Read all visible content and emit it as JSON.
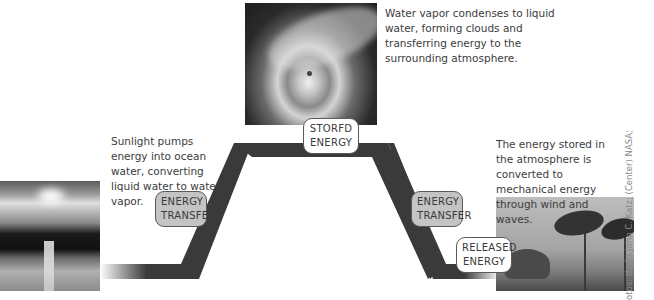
{
  "captions": {
    "condense": "Water vapor condenses to liquid water, forming clouds and transferring energy to the surrounding atmosphere.",
    "sunlight": "Sunlight pumps energy into ocean water, converting liquid water to water vapor.",
    "release": "The energy stored in the atmosphere is converted to mechanical energy through wind and waves."
  },
  "labels": {
    "stored": "STORED ENERGY",
    "stored_line1": "STORFD",
    "stored_line2": "ENERGY",
    "transfer_left_line1": "ENERGY",
    "transfer_left_line2": "TRANSFER",
    "transfer_right_line1": "ENERGY",
    "transfer_right_line2": "TRANSFER",
    "released_line1": "RELEASED",
    "released_line2": "ENERGY"
  },
  "photos": {
    "left": "sunset-over-ocean-photo",
    "center": "hurricane-satellite-photo",
    "right": "palm-trees-in-storm-photo"
  },
  "credit": "otos: (Left) John C. Katz; (Center) NASA;",
  "colors": {
    "band": "#3a3a3a",
    "label_grey": "#c4c4c4",
    "label_white": "#ffffff"
  }
}
